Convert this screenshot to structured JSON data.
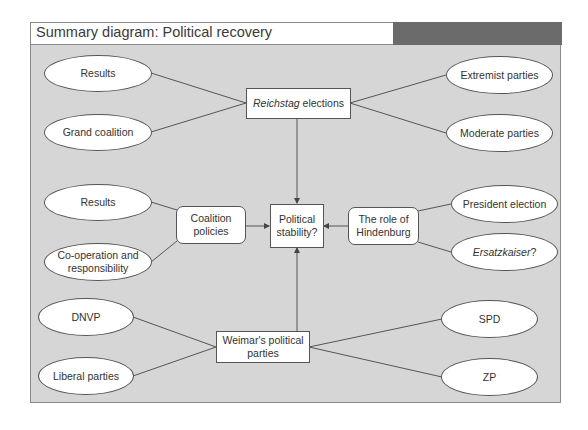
{
  "header": {
    "title": "Summary diagram: Political recovery"
  },
  "center": {
    "label_line1": "Political",
    "label_line2": "stability?"
  },
  "reichstag": {
    "label_italic": "Reichstag",
    "label_rest": " elections"
  },
  "reichstag_left": [
    {
      "label": "Results"
    },
    {
      "label": "Grand coalition"
    }
  ],
  "reichstag_right": [
    {
      "label": "Extremist parties"
    },
    {
      "label": "Moderate parties"
    }
  ],
  "coalition": {
    "label_line1": "Coalition",
    "label_line2": "policies"
  },
  "coalition_left": [
    {
      "label": "Results"
    },
    {
      "label_line1": "Co-operation and",
      "label_line2": "responsibility"
    }
  ],
  "hindenburg": {
    "label_line1": "The role of",
    "label_line2": "Hindenburg"
  },
  "hindenburg_right": [
    {
      "label": "President election"
    },
    {
      "label_italic": "Ersatzkaiser",
      "label_rest": "?"
    }
  ],
  "parties": {
    "label_line1": "Weimar's political",
    "label_line2": "parties"
  },
  "parties_left": [
    {
      "label": "DNVP"
    },
    {
      "label": "Liberal parties"
    }
  ],
  "parties_right": [
    {
      "label": "SPD"
    },
    {
      "label": "ZP"
    }
  ],
  "colors": {
    "panel": "#d6d6d6",
    "title_dark": "#6b6b6b",
    "border": "#555555"
  }
}
